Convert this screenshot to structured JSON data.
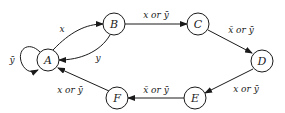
{
  "diagram": {
    "type": "state-machine",
    "nodes": [
      {
        "id": "A",
        "label": "A"
      },
      {
        "id": "B",
        "label": "B"
      },
      {
        "id": "C",
        "label": "C"
      },
      {
        "id": "D",
        "label": "D"
      },
      {
        "id": "E",
        "label": "E"
      },
      {
        "id": "F",
        "label": "F"
      }
    ],
    "edges": [
      {
        "from": "A",
        "to": "A",
        "label": "ȳ"
      },
      {
        "from": "A",
        "to": "B",
        "label": "x"
      },
      {
        "from": "B",
        "to": "A",
        "label": "y"
      },
      {
        "from": "B",
        "to": "C",
        "label": "x or ȳ"
      },
      {
        "from": "C",
        "to": "D",
        "label": "x̄ or ȳ"
      },
      {
        "from": "D",
        "to": "E",
        "label": "x or ȳ"
      },
      {
        "from": "E",
        "to": "F",
        "label": "x̄ or ȳ"
      },
      {
        "from": "F",
        "to": "A",
        "label": "x or ȳ"
      }
    ],
    "colors": {
      "stroke": "#1a1a1a",
      "background": "#ffffff"
    }
  }
}
